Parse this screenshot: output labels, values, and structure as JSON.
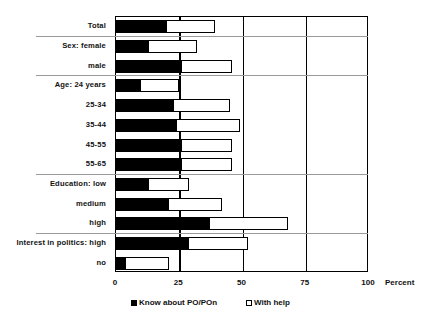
{
  "chart_data": {
    "type": "bar",
    "orientation": "horizontal",
    "title": "",
    "xlabel": "Percent",
    "ylabel": "",
    "xlim": [
      0,
      100
    ],
    "xticks": [
      0,
      25,
      50,
      75,
      100
    ],
    "xtick_labels": [
      "0",
      "25",
      "50",
      "75",
      "100"
    ],
    "grid": true,
    "legend_position": "bottom",
    "categories": [
      "Total",
      "Sex: female",
      "male",
      "Age: 24 years",
      "25-34",
      "35-44",
      "45-55",
      "55-65",
      "Education: low",
      "medium",
      "high",
      "Interest in politics: high",
      "no"
    ],
    "series": [
      {
        "name": "Know about PO/POn",
        "style": "filled-black",
        "values": [
          20,
          13,
          26,
          10,
          23,
          24,
          26,
          26,
          13,
          21,
          37,
          29,
          4
        ]
      },
      {
        "name": "With help",
        "style": "hollow-white",
        "values": [
          39,
          32,
          46,
          25,
          45,
          49,
          46,
          46,
          29,
          42,
          68,
          52,
          21
        ]
      }
    ],
    "group_separators_after": [
      "Total",
      "male",
      "55-65",
      "high"
    ],
    "legend_entries": [
      {
        "label": "Know about PO/POn",
        "swatch": "filled"
      },
      {
        "label": "With help",
        "swatch": "hollow"
      }
    ]
  },
  "axis": {
    "unit_label": "Percent"
  }
}
